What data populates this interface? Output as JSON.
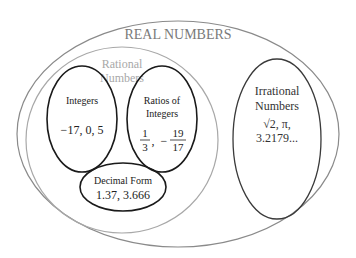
{
  "diagram": {
    "real": {
      "label": "REAL NUMBERS",
      "color": "#7a7a7a"
    },
    "rational": {
      "line1": "Rational",
      "line2": "Numbers",
      "color": "#a8a8a8"
    },
    "integers": {
      "label": "Integers",
      "examples": "−17, 0, 5"
    },
    "ratios": {
      "line1": "Ratios of",
      "line2": "Integers",
      "frac1_num": "1",
      "frac1_den": "3",
      "sep": ",",
      "minus": "−",
      "frac2_num": "19",
      "frac2_den": "17"
    },
    "decimal": {
      "label": "Decimal Form",
      "examples": "1.37, 3.666"
    },
    "irrational": {
      "line1": "Irrational",
      "line2": "Numbers",
      "ex1": "√2, π,",
      "ex2": "3.2179..."
    }
  }
}
